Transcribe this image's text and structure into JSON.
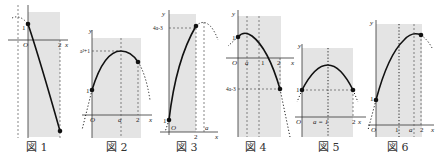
{
  "figures": [
    {
      "caption": "図 1",
      "labels": {
        "origin": "O",
        "y_intercept": "1",
        "x_end": "2",
        "x_axis": "x"
      }
    },
    {
      "caption": "図 2",
      "labels": {
        "origin": "O",
        "y_axis": "y",
        "x_axis": "x",
        "vertex_y": "a²+1",
        "y_intercept": "1",
        "vertex_x": "a",
        "x_end": "2"
      }
    },
    {
      "caption": "図 3",
      "labels": {
        "origin": "O",
        "y_axis": "y",
        "x_axis": "x",
        "end_y": "4a-3",
        "y_intercept": "1",
        "x_end": "2",
        "vertex_x": "a"
      }
    },
    {
      "caption": "図 4",
      "labels": {
        "origin": "O",
        "y_axis": "y",
        "x_axis": "x",
        "y_intercept": "1",
        "vertex_x": "a",
        "mid": "1",
        "x_end": "2",
        "end_y": "4a-3"
      }
    },
    {
      "caption": "図 5",
      "labels": {
        "origin": "O",
        "y_axis": "y",
        "x_axis": "x",
        "y_intercept": "1",
        "vertex_x": "a = 1",
        "x_end": "2"
      }
    },
    {
      "caption": "図 6",
      "labels": {
        "origin": "O",
        "y_axis": "y",
        "x_axis": "x",
        "y_intercept": "1",
        "mid": "1",
        "vertex_x": "a",
        "x_end": "2"
      }
    }
  ]
}
